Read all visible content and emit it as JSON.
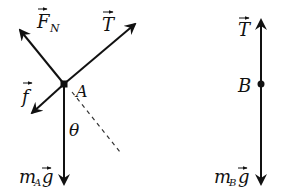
{
  "diagram": {
    "type": "free-body-diagram",
    "stroke_color": "#111111",
    "background": "#ffffff",
    "bodies": [
      {
        "name": "A",
        "label": "A",
        "point": [
          64,
          84
        ],
        "forces": [
          {
            "id": "normal-force",
            "symbol": "F",
            "subscript": "N",
            "vector": true,
            "tip": [
              18,
              28
            ]
          },
          {
            "id": "tension-a",
            "symbol": "T",
            "subscript": "",
            "vector": true,
            "tip": [
              137,
              22
            ]
          },
          {
            "id": "friction",
            "symbol": "f",
            "subscript": "",
            "vector": true,
            "tip": [
              30,
              115
            ]
          },
          {
            "id": "weight-a",
            "symbol": "m",
            "subscript": "A",
            "suffix": "g",
            "vector": true,
            "tip": [
              64,
              186
            ]
          }
        ],
        "angle_label": "θ",
        "reference_line": "dashed"
      },
      {
        "name": "B",
        "label": "B",
        "point": [
          261,
          84
        ],
        "forces": [
          {
            "id": "tension-b",
            "symbol": "T",
            "subscript": "",
            "vector": true,
            "tip": [
              261,
              18
            ]
          },
          {
            "id": "weight-b",
            "symbol": "m",
            "subscript": "B",
            "suffix": "g",
            "vector": true,
            "tip": [
              261,
              186
            ]
          }
        ]
      }
    ],
    "labels": {
      "fn_main": "F",
      "fn_sub": "N",
      "t_a": "T",
      "f": "f",
      "a": "A",
      "theta": "θ",
      "ma_m": "m",
      "ma_sub": "A",
      "ma_g": "g",
      "t_b": "T",
      "b": "B",
      "mb_m": "m",
      "mb_sub": "B",
      "mb_g": "g"
    }
  }
}
